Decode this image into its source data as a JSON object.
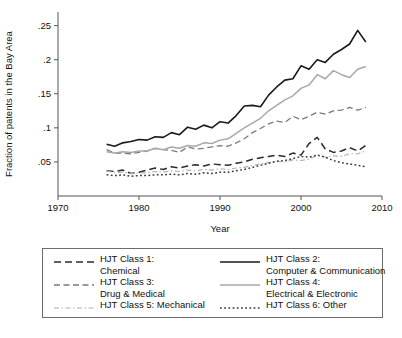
{
  "chart_data": {
    "type": "line",
    "title": "",
    "xlabel": "Year",
    "ylabel": "Fraction of patents in the Bay Area",
    "xlim": [
      1970,
      2010
    ],
    "ylim": [
      0,
      0.27
    ],
    "xticks": [
      1970,
      1980,
      1990,
      2000,
      2010
    ],
    "xtick_labels": [
      "1970",
      "1980",
      "1990",
      "2000",
      "2010"
    ],
    "yticks": [
      0.05,
      0.1,
      0.15,
      0.2,
      0.25
    ],
    "ytick_labels": [
      ".05",
      ".1",
      ".15",
      ".2",
      ".25"
    ],
    "grid": false,
    "legend_position": "below-plot",
    "x": [
      1976,
      1977,
      1978,
      1979,
      1980,
      1981,
      1982,
      1983,
      1984,
      1985,
      1986,
      1987,
      1988,
      1989,
      1990,
      1991,
      1992,
      1993,
      1994,
      1995,
      1996,
      1997,
      1998,
      1999,
      2000,
      2001,
      2002,
      2003,
      2004,
      2005,
      2006,
      2007,
      2008
    ],
    "series": [
      {
        "name": "HJT Class 1: Chemical",
        "key": "class1",
        "color": "#2b2b2b",
        "dash": "7,4",
        "width": 1.5,
        "values": [
          0.037,
          0.036,
          0.038,
          0.033,
          0.035,
          0.038,
          0.041,
          0.039,
          0.043,
          0.041,
          0.044,
          0.046,
          0.044,
          0.047,
          0.046,
          0.045,
          0.048,
          0.05,
          0.054,
          0.056,
          0.058,
          0.06,
          0.058,
          0.063,
          0.06,
          0.077,
          0.086,
          0.069,
          0.064,
          0.066,
          0.071,
          0.066,
          0.074
        ]
      },
      {
        "name": "HJT Class 2: Computer & Communication",
        "key": "class2",
        "color": "#1a1a1a",
        "dash": "none",
        "width": 1.6,
        "values": [
          0.076,
          0.073,
          0.078,
          0.08,
          0.083,
          0.082,
          0.087,
          0.086,
          0.093,
          0.09,
          0.101,
          0.098,
          0.104,
          0.1,
          0.109,
          0.107,
          0.118,
          0.132,
          0.133,
          0.131,
          0.148,
          0.16,
          0.17,
          0.172,
          0.191,
          0.186,
          0.2,
          0.196,
          0.208,
          0.215,
          0.223,
          0.243,
          0.226
        ]
      },
      {
        "name": "HJT Class 3: Drug & Medical",
        "key": "class3",
        "color": "#7a7a7a",
        "dash": "6,3.5",
        "width": 1.3,
        "values": [
          0.068,
          0.063,
          0.063,
          0.062,
          0.064,
          0.066,
          0.07,
          0.068,
          0.067,
          0.064,
          0.072,
          0.069,
          0.07,
          0.072,
          0.074,
          0.073,
          0.078,
          0.084,
          0.093,
          0.099,
          0.106,
          0.11,
          0.108,
          0.117,
          0.112,
          0.117,
          0.123,
          0.12,
          0.125,
          0.126,
          0.13,
          0.126,
          0.13
        ]
      },
      {
        "name": "HJT Class 4: Electrical & Electronic",
        "key": "class4",
        "color": "#a8a8a8",
        "dash": "none",
        "width": 1.5,
        "values": [
          0.065,
          0.063,
          0.065,
          0.064,
          0.066,
          0.066,
          0.07,
          0.068,
          0.072,
          0.07,
          0.074,
          0.073,
          0.078,
          0.077,
          0.082,
          0.084,
          0.092,
          0.1,
          0.107,
          0.114,
          0.125,
          0.133,
          0.141,
          0.147,
          0.158,
          0.163,
          0.178,
          0.172,
          0.184,
          0.178,
          0.174,
          0.186,
          0.19
        ]
      },
      {
        "name": "HJT Class 5: Mechanical",
        "key": "class5",
        "color": "#b0b0b0",
        "dash": "5,2.5,1.5,2.5",
        "width": 1.1,
        "values": [
          0.037,
          0.034,
          0.035,
          0.033,
          0.034,
          0.034,
          0.036,
          0.035,
          0.037,
          0.036,
          0.038,
          0.037,
          0.039,
          0.038,
          0.04,
          0.039,
          0.041,
          0.042,
          0.045,
          0.047,
          0.049,
          0.051,
          0.05,
          0.053,
          0.052,
          0.054,
          0.06,
          0.057,
          0.059,
          0.058,
          0.062,
          0.062,
          0.066
        ]
      },
      {
        "name": "HJT Class 6: Other",
        "key": "class6",
        "color": "#3a3a3a",
        "dash": "1.8,2.4",
        "width": 1.5,
        "values": [
          0.031,
          0.03,
          0.031,
          0.029,
          0.03,
          0.03,
          0.031,
          0.031,
          0.032,
          0.031,
          0.033,
          0.032,
          0.034,
          0.033,
          0.035,
          0.035,
          0.037,
          0.039,
          0.042,
          0.045,
          0.048,
          0.051,
          0.052,
          0.055,
          0.058,
          0.057,
          0.06,
          0.057,
          0.052,
          0.049,
          0.047,
          0.045,
          0.043
        ]
      }
    ]
  },
  "legend": {
    "entries": [
      {
        "id": "class1",
        "line1": "HJT Class 1:",
        "line2": "Chemical"
      },
      {
        "id": "class2",
        "line1": "HJT Class 2:",
        "line2": "Computer & Communication"
      },
      {
        "id": "class3",
        "line1": "HJT Class 3:",
        "line2": "Drug & Medical"
      },
      {
        "id": "class4",
        "line1": "HJT Class 4:",
        "line2": "Electrical & Electronic"
      },
      {
        "id": "class5",
        "line1": "HJT Class 5: Mechanical",
        "line2": ""
      },
      {
        "id": "class6",
        "line1": "HJT Class 6: Other",
        "line2": ""
      }
    ]
  },
  "axes": {
    "ylabel": "Fraction of patents in the Bay Area",
    "xlabel": "Year"
  }
}
